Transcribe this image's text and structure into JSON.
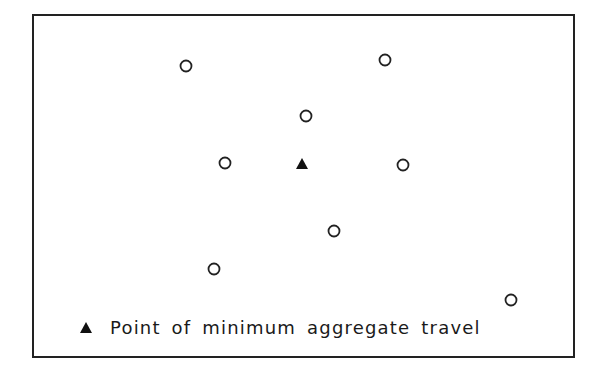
{
  "figure": {
    "frame": {
      "x1": 33,
      "y1": 15,
      "x2": 574,
      "y2": 357,
      "stroke": "#222222"
    },
    "legend": {
      "marker": "filled-triangle",
      "label": "Point of minimum aggregate travel"
    },
    "points": [
      {
        "id": "p1",
        "type": "origin",
        "x": 186,
        "y": 66
      },
      {
        "id": "p2",
        "type": "origin",
        "x": 385,
        "y": 60
      },
      {
        "id": "p3",
        "type": "origin",
        "x": 306,
        "y": 116
      },
      {
        "id": "p4",
        "type": "origin",
        "x": 225,
        "y": 163
      },
      {
        "id": "p5",
        "type": "origin",
        "x": 403,
        "y": 165
      },
      {
        "id": "p6",
        "type": "origin",
        "x": 334,
        "y": 231
      },
      {
        "id": "p7",
        "type": "origin",
        "x": 214,
        "y": 269
      },
      {
        "id": "p8",
        "type": "origin",
        "x": 511,
        "y": 300
      }
    ],
    "optimum": {
      "x": 302,
      "y": 164,
      "label": "Point of minimum aggregate travel"
    }
  }
}
